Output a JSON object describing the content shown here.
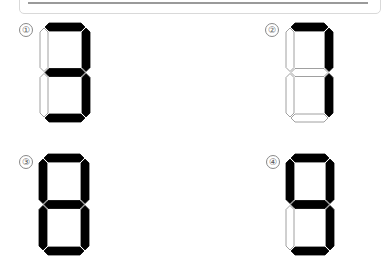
{
  "options": [
    {
      "label": "①",
      "digit": "3",
      "segments": {
        "a": 1,
        "b": 1,
        "c": 1,
        "d": 1,
        "e": 0,
        "f": 0,
        "g": 1
      },
      "x": 40,
      "y": 23,
      "w": 50,
      "h": 99,
      "label_x": 19,
      "label_y": 23
    },
    {
      "label": "②",
      "digit": "7",
      "segments": {
        "a": 1,
        "b": 1,
        "c": 1,
        "d": 0,
        "e": 0,
        "f": 0,
        "g": 0
      },
      "x": 286,
      "y": 23,
      "w": 47,
      "h": 99,
      "label_x": 265,
      "label_y": 23
    },
    {
      "label": "③",
      "digit": "8",
      "segments": {
        "a": 1,
        "b": 1,
        "c": 1,
        "d": 1,
        "e": 1,
        "f": 1,
        "g": 1
      },
      "x": 39,
      "y": 154,
      "w": 50,
      "h": 101,
      "label_x": 19,
      "label_y": 155
    },
    {
      "label": "④",
      "digit": "9",
      "segments": {
        "a": 1,
        "b": 1,
        "c": 1,
        "d": 1,
        "e": 0,
        "f": 1,
        "g": 1
      },
      "x": 286,
      "y": 154,
      "w": 48,
      "h": 101,
      "label_x": 266,
      "label_y": 155
    }
  ],
  "colors": {
    "on": "#000000",
    "off": "#ffffff",
    "stroke": "#888888"
  }
}
